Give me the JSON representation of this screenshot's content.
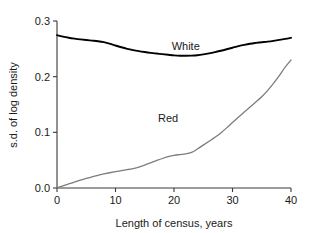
{
  "chart_data": {
    "type": "line",
    "title": "",
    "xlabel": "Length of census, years",
    "ylabel": "s.d. of log density",
    "xlim": [
      0,
      40
    ],
    "ylim": [
      0.0,
      0.3
    ],
    "grid": false,
    "legend_position": "inline-annotation",
    "xticks": [
      "0",
      "10",
      "20",
      "30",
      "40"
    ],
    "xtick_values": [
      0,
      10,
      20,
      30,
      40
    ],
    "yticks": [
      "0.0",
      "0.1",
      "0.2",
      "0.3"
    ],
    "ytick_values": [
      0.0,
      0.1,
      0.2,
      0.3
    ],
    "series": [
      {
        "name": "White",
        "color": "#000000",
        "label_x": 22,
        "label_y": 0.248,
        "x": [
          0,
          1,
          2,
          3,
          4,
          5,
          6,
          7,
          8,
          9,
          10,
          11,
          12,
          13,
          14,
          15,
          16,
          17,
          18,
          19,
          20,
          21,
          22,
          23,
          24,
          25,
          26,
          27,
          28,
          29,
          30,
          31,
          32,
          33,
          34,
          35,
          36,
          37,
          38,
          39,
          40
        ],
        "values": [
          0.2745,
          0.272,
          0.27,
          0.2684,
          0.267,
          0.2658,
          0.2648,
          0.2637,
          0.262,
          0.2592,
          0.256,
          0.2528,
          0.25,
          0.2477,
          0.2458,
          0.2442,
          0.2428,
          0.2416,
          0.2404,
          0.2393,
          0.2383,
          0.2377,
          0.2375,
          0.2378,
          0.2386,
          0.24,
          0.2418,
          0.244,
          0.2465,
          0.2492,
          0.252,
          0.2548,
          0.2572,
          0.2592,
          0.2606,
          0.2618,
          0.263,
          0.2644,
          0.266,
          0.2678,
          0.2698
        ]
      },
      {
        "name": "Red",
        "color": "#7d7d7d",
        "label_x": 19,
        "label_y": 0.118,
        "x": [
          0,
          1,
          2,
          3,
          4,
          5,
          6,
          7,
          8,
          9,
          10,
          11,
          12,
          13,
          14,
          15,
          16,
          17,
          18,
          19,
          20,
          21,
          22,
          23,
          24,
          25,
          26,
          27,
          28,
          29,
          30,
          31,
          32,
          33,
          34,
          35,
          36,
          37,
          38,
          39,
          40
        ],
        "values": [
          0.0005,
          0.0038,
          0.0072,
          0.0106,
          0.014,
          0.0172,
          0.0202,
          0.0228,
          0.0252,
          0.0274,
          0.0294,
          0.0312,
          0.033,
          0.035,
          0.0376,
          0.0412,
          0.0452,
          0.0492,
          0.053,
          0.0562,
          0.0586,
          0.06,
          0.0612,
          0.064,
          0.07,
          0.077,
          0.084,
          0.091,
          0.099,
          0.108,
          0.1175,
          0.127,
          0.1365,
          0.1455,
          0.1545,
          0.164,
          0.175,
          0.188,
          0.202,
          0.217,
          0.23
        ]
      }
    ]
  }
}
